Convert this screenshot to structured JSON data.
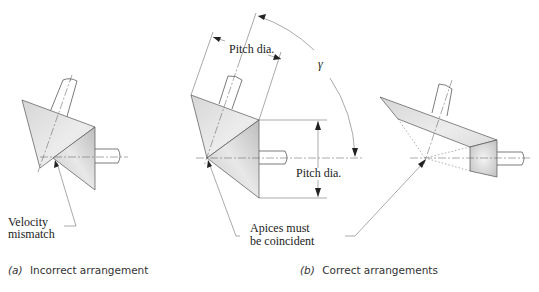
{
  "figure": {
    "panels": [
      {
        "id": "a",
        "caption_letter": "(a)",
        "caption_text": "Incorrect arrangement",
        "annotations": [
          "Velocity",
          "mismatch"
        ]
      },
      {
        "id": "b",
        "caption_letter": "(b)",
        "caption_text": "Correct arrangements",
        "annotations": {
          "pitch_dia_top": "Pitch dia.",
          "pitch_dia_side": "Pitch dia.",
          "angle_label": "γ",
          "apices_line1": "Apices must",
          "apices_line2": "be coincident"
        }
      }
    ],
    "colors": {
      "gear_fill_light": "#e4e4e4",
      "gear_fill_dark": "#c4c4c4",
      "line": "#444444"
    }
  }
}
